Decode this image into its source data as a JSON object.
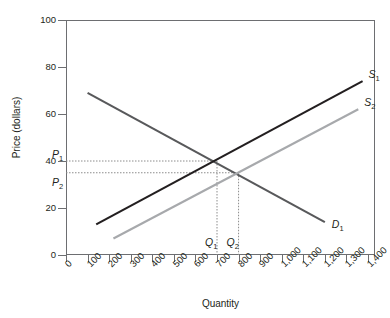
{
  "chart_data": {
    "type": "line",
    "title": "",
    "xlabel": "Quantity",
    "ylabel": "Price (dollars)",
    "xlim": [
      0,
      1400
    ],
    "ylim": [
      0,
      100
    ],
    "grid": false,
    "legend": "none (curves labelled inline)",
    "x_ticks": [
      0,
      100,
      200,
      300,
      400,
      500,
      600,
      700,
      800,
      900,
      1000,
      1100,
      1200,
      1300,
      1400
    ],
    "x_tick_labels": [
      "0",
      "100",
      "200",
      "300",
      "400",
      "500",
      "600",
      "700",
      "800",
      "900",
      "1,000",
      "1,100",
      "1,200",
      "1,300",
      "1,400"
    ],
    "y_ticks": [
      0,
      20,
      40,
      60,
      80,
      100
    ],
    "y_tick_labels": [
      "0",
      "20",
      "40",
      "60",
      "80",
      "100"
    ],
    "series": [
      {
        "name": "D1",
        "label": "D",
        "sublabel": "1",
        "kind": "demand",
        "color": "#58595b",
        "points": [
          [
            100,
            69
          ],
          [
            1200,
            14
          ]
        ]
      },
      {
        "name": "S1",
        "label": "S",
        "sublabel": "1",
        "kind": "supply",
        "color": "#231f20",
        "points": [
          [
            140,
            13
          ],
          [
            1375,
            74
          ]
        ]
      },
      {
        "name": "S2",
        "label": "S",
        "sublabel": "2",
        "kind": "supply",
        "color": "#a7a9ac",
        "points": [
          [
            220,
            7
          ],
          [
            1355,
            62
          ]
        ]
      }
    ],
    "annotations": [
      {
        "name": "P1",
        "label": "P",
        "sublabel": "1",
        "axis": "y",
        "value": 40
      },
      {
        "name": "P2",
        "label": "P",
        "sublabel": "2",
        "axis": "y",
        "value": 35
      },
      {
        "name": "Q1",
        "label": "Q",
        "sublabel": "1",
        "axis": "x",
        "value": 700
      },
      {
        "name": "Q2",
        "label": "Q",
        "sublabel": "2",
        "axis": "x",
        "value": 800
      }
    ],
    "equilibria": [
      {
        "name": "equilibrium-1",
        "quantity": 700,
        "price": 40,
        "curves": [
          "D1",
          "S1"
        ]
      },
      {
        "name": "equilibrium-2",
        "quantity": 800,
        "price": 35,
        "curves": [
          "D1",
          "S2"
        ]
      }
    ],
    "guide_line_color": "#8c8c8c"
  }
}
